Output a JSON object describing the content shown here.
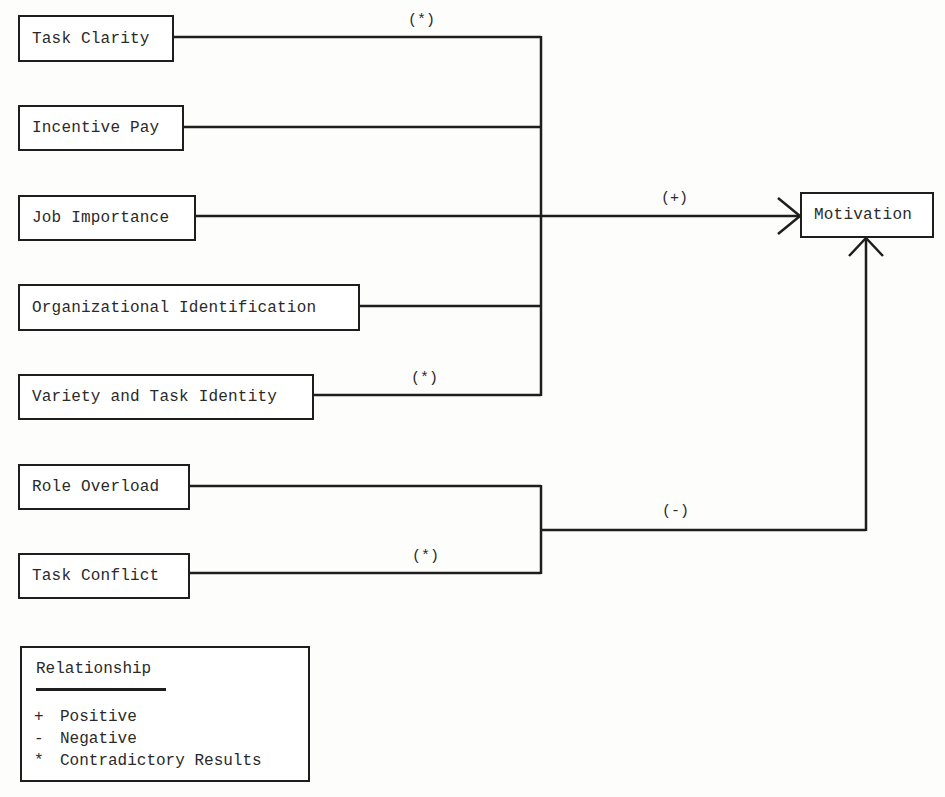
{
  "diagram": {
    "target": {
      "label": "Motivation"
    },
    "factors": [
      {
        "label": "Task Clarity",
        "relationship": "*"
      },
      {
        "label": "Incentive Pay",
        "relationship": "+"
      },
      {
        "label": "Job Importance",
        "relationship": "+"
      },
      {
        "label": "Organizational Identification",
        "relationship": "+"
      },
      {
        "label": "Variety and Task Identity",
        "relationship": "*"
      },
      {
        "label": "Role Overload",
        "relationship": "-"
      },
      {
        "label": "Task Conflict",
        "relationship": "*"
      }
    ],
    "edge_labels": {
      "task_clarity": "(*)",
      "variety": "(*)",
      "positive_group": "(+)",
      "negative_group": "(-)",
      "task_conflict": "(*)"
    }
  },
  "legend": {
    "title": "Relationship",
    "items": [
      {
        "symbol": "+",
        "label": "Positive"
      },
      {
        "symbol": "-",
        "label": "Negative"
      },
      {
        "symbol": "*",
        "label": "Contradictory Results"
      }
    ]
  }
}
